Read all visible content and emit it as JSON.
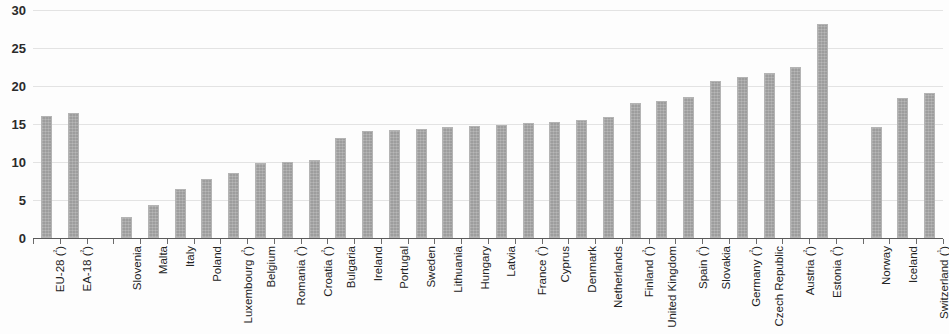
{
  "chart_data": {
    "type": "bar",
    "title": "",
    "subtitle": "",
    "xlabel": "",
    "ylabel": "",
    "ylim": [
      0,
      30
    ],
    "yticks": [
      0,
      5,
      10,
      15,
      20,
      25,
      30
    ],
    "ytick_labels": [
      "0",
      "5",
      "10",
      "15",
      "20",
      "25",
      "30"
    ],
    "grid": true,
    "legend": "none",
    "orientation": "vertical",
    "bar_color": "#9d9d9d",
    "gridline_color": "#e3e3e3",
    "axis_color": "#5a5a5a",
    "groups": [
      {
        "name": "aggregates",
        "gap_after": true
      },
      {
        "name": "member-states",
        "gap_after": true
      },
      {
        "name": "non-member-countries",
        "gap_after": false
      }
    ],
    "categories": [
      "EU-28 (²)",
      "EA-18 (²)",
      "Slovenia",
      "Malta",
      "Italy",
      "Poland",
      "Luxembourg (²)",
      "Belgium",
      "Romania (³)",
      "Croatia (²)",
      "Bulgaria",
      "Ireland",
      "Portugal",
      "Sweden",
      "Lithuania",
      "Hungary",
      "Latvia",
      "France (²)",
      "Cyprus",
      "Denmark",
      "Netherlands",
      "Finland (²)",
      "United Kingdom",
      "Spain (²)",
      "Slovakia",
      "Germany (²)",
      "Czech Republic",
      "Austria (²)",
      "Estonia (²)",
      "Norway",
      "Iceland",
      "Switzerland (¹)"
    ],
    "values": [
      16.0,
      16.4,
      2.8,
      4.4,
      6.4,
      7.7,
      8.6,
      9.9,
      10.0,
      10.3,
      13.2,
      14.1,
      14.2,
      14.4,
      14.6,
      14.7,
      14.9,
      15.1,
      15.2,
      15.5,
      15.9,
      17.7,
      18.0,
      18.6,
      20.7,
      21.2,
      21.7,
      22.5,
      28.1,
      14.6,
      18.4,
      19.1
    ],
    "group_index": [
      0,
      0,
      1,
      1,
      1,
      1,
      1,
      1,
      1,
      1,
      1,
      1,
      1,
      1,
      1,
      1,
      1,
      1,
      1,
      1,
      1,
      1,
      1,
      1,
      1,
      1,
      1,
      1,
      1,
      2,
      2,
      2
    ]
  }
}
